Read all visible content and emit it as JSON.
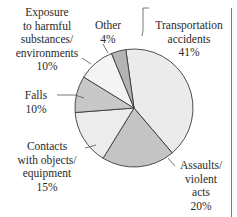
{
  "chart_data": {
    "type": "pie",
    "title": "",
    "categories": [
      "Transportation accidents",
      "Assaults/ violent acts",
      "Contacts with objects/ equipment",
      "Falls",
      "Exposure to harmful substances/ environments",
      "Other"
    ],
    "values": [
      41,
      20,
      15,
      10,
      10,
      4
    ],
    "unit": "%",
    "colors": [
      "#ebebeb",
      "#c4c4c4",
      "#ececec",
      "#c8c8c8",
      "#f4f4f4",
      "#b4b4b4"
    ],
    "start_angle_deg": -8,
    "direction": "clockwise"
  },
  "labels": {
    "transportation": {
      "lines": [
        "Transportation",
        "accidents",
        "41%"
      ]
    },
    "assaults": {
      "lines": [
        "Assaults/",
        "violent",
        "acts",
        "20%"
      ]
    },
    "contacts": {
      "lines": [
        "Contacts",
        "with objects/",
        "equipment",
        "15%"
      ]
    },
    "falls": {
      "lines": [
        "Falls",
        "10%"
      ]
    },
    "exposure": {
      "lines": [
        "Exposure",
        "to harmful",
        "substances/",
        "environments",
        "10%"
      ]
    },
    "other": {
      "lines": [
        "Other",
        "4%"
      ]
    }
  }
}
